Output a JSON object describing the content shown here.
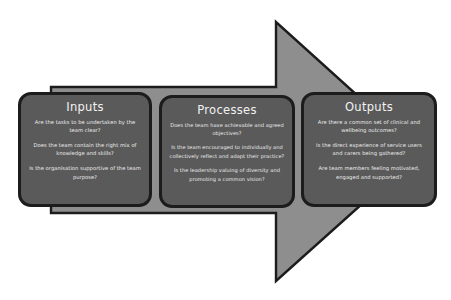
{
  "diagram": {
    "type": "process-arrow",
    "background_color": "#ffffff",
    "arrow": {
      "name": "right-pointing-arrow",
      "fill_color": "#8e8e8e",
      "outline_color": "#1c1c1c",
      "direction": "right"
    },
    "box_style": {
      "fill_color": "#5a5a5a",
      "border_color": "#1c1c1c",
      "text_color": "#ececec"
    },
    "stages": [
      {
        "id": "inputs",
        "title": "Inputs",
        "questions": [
          "Are the tasks to be undertaken by the team clear?",
          "Does the team contain the right mix of knowledge and skills?",
          "Is the organisation supportive of the team purpose?"
        ]
      },
      {
        "id": "processes",
        "title": "Processes",
        "questions": [
          "Does the team have achievable and agreed objectives?",
          "Is the team encouraged to individually and collectively reflect and adapt their practice?",
          "Is the leadership valuing of diversity and promoting a common vision?"
        ]
      },
      {
        "id": "outputs",
        "title": "Outputs",
        "questions": [
          "Are there a common set of clinical and wellbeing outcomes?",
          "Is the direct experience of service users and carers being gathered?",
          "Are team members feeling motivated, engaged and supported?"
        ]
      }
    ]
  }
}
